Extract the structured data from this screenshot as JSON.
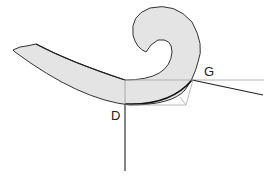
{
  "diagram": {
    "labels": {
      "point_d": "D",
      "point_g": "G"
    },
    "colors": {
      "shape_fill": "#e4e4e4",
      "shape_stroke": "#333333",
      "construction_line": "#aaaaaa",
      "tangent_line": "#222222"
    }
  }
}
